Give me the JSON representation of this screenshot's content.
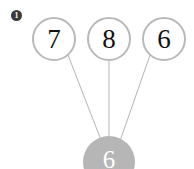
{
  "diagram": {
    "type": "number-bond",
    "title_badge": "1",
    "colors": {
      "circle_stroke": "#b9b9b9",
      "circle_fill": "#ffffff",
      "number_text": "#111111",
      "sum_fill": "#b6b6b6",
      "sum_text": "#ffffff",
      "line": "#b5b5b5",
      "badge_fill": "#3a3a3a",
      "badge_text": "#ffffff",
      "background": "#ffffff"
    },
    "top_nodes": [
      {
        "value": "7",
        "name": "addend-1"
      },
      {
        "value": "8",
        "name": "addend-2"
      },
      {
        "value": "6",
        "name": "addend-3"
      }
    ],
    "bottom_node": {
      "value": "6",
      "name": "result"
    },
    "connectors": [
      {
        "from": "addend-1",
        "to": "result"
      },
      {
        "from": "addend-2",
        "to": "result"
      },
      {
        "from": "addend-3",
        "to": "result"
      }
    ]
  }
}
